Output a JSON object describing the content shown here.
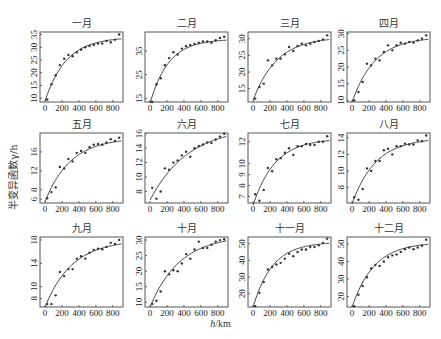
{
  "figure": {
    "ylabel": "半变异函数γ/h",
    "xlabel_var": "h",
    "xlabel_unit": "/km"
  },
  "chart_data": [
    {
      "type": "scatter",
      "title": "一月",
      "xlabel": "h/km",
      "ylabel": "半变异函数γ/h",
      "xlim": [
        -60,
        920
      ],
      "ylim": [
        8.5,
        36
      ],
      "xticks": [
        0,
        200,
        400,
        600,
        800
      ],
      "yticks": [
        10,
        15,
        20,
        25,
        30,
        35
      ],
      "x": [
        25,
        75,
        125,
        175,
        225,
        275,
        325,
        375,
        425,
        475,
        525,
        575,
        625,
        675,
        725,
        775,
        825,
        875
      ],
      "y": [
        9.5,
        15.5,
        19,
        23,
        25.5,
        27,
        26.5,
        28,
        29,
        30,
        30.5,
        31,
        31.5,
        31.5,
        32.5,
        32,
        33,
        35
      ],
      "fit": {
        "nugget": 9,
        "sill": 34,
        "range": 250
      }
    },
    {
      "type": "scatter",
      "title": "二月",
      "xlabel": "h/km",
      "ylabel": "半变异函数γ/h",
      "xlim": [
        -60,
        920
      ],
      "ylim": [
        13.5,
        43
      ],
      "xticks": [
        0,
        200,
        400,
        600,
        800
      ],
      "yticks": [
        15,
        25,
        35
      ],
      "x": [
        25,
        75,
        125,
        175,
        225,
        275,
        325,
        375,
        425,
        475,
        525,
        575,
        625,
        675,
        725,
        775,
        825,
        875
      ],
      "y": [
        13.5,
        21,
        23.5,
        29,
        32,
        34.5,
        33.5,
        36,
        37,
        37.5,
        38,
        38.5,
        39,
        39,
        38.5,
        39.5,
        40.5,
        41
      ],
      "fit": {
        "nugget": 13,
        "sill": 40,
        "range": 220
      }
    },
    {
      "type": "scatter",
      "title": "三月",
      "xlabel": "h/km",
      "ylabel": "半变异函数γ/h",
      "xlim": [
        -60,
        920
      ],
      "ylim": [
        11,
        32
      ],
      "xticks": [
        0,
        200,
        400,
        600,
        800
      ],
      "yticks": [
        15,
        20,
        25,
        30
      ],
      "x": [
        25,
        75,
        125,
        175,
        225,
        275,
        325,
        375,
        425,
        475,
        525,
        575,
        625,
        675,
        725,
        775,
        825,
        875
      ],
      "y": [
        12,
        15.5,
        16.5,
        23.5,
        22,
        24,
        24,
        25.3,
        27.5,
        26.3,
        27.8,
        28.5,
        28,
        28.5,
        29,
        29.3,
        29.8,
        31
      ],
      "fit": {
        "nugget": 11.5,
        "sill": 30.5,
        "range": 280
      }
    },
    {
      "type": "scatter",
      "title": "四月",
      "xlabel": "h/km",
      "ylabel": "半变异函数γ/h",
      "xlim": [
        -60,
        920
      ],
      "ylim": [
        9.5,
        30.5
      ],
      "xticks": [
        0,
        200,
        400,
        600,
        800
      ],
      "yticks": [
        10,
        15,
        20,
        25,
        30
      ],
      "x": [
        25,
        75,
        125,
        175,
        225,
        275,
        325,
        375,
        425,
        475,
        525,
        575,
        625,
        675,
        725,
        775,
        825,
        875
      ],
      "y": [
        10,
        12.5,
        15.5,
        21,
        20.5,
        22.5,
        22,
        24.5,
        26.5,
        25,
        26.5,
        27.3,
        27,
        27.5,
        27.3,
        28,
        28.5,
        29.5
      ],
      "fit": {
        "nugget": 9.5,
        "sill": 29,
        "range": 270
      }
    },
    {
      "type": "scatter",
      "title": "五月",
      "xlabel": "h/km",
      "ylabel": "半变异函数γ/h",
      "xlim": [
        -60,
        920
      ],
      "ylim": [
        5.2,
        20
      ],
      "xticks": [
        0,
        200,
        400,
        600,
        800
      ],
      "yticks": [
        6,
        8,
        12,
        16
      ],
      "x": [
        25,
        75,
        125,
        175,
        225,
        275,
        325,
        375,
        425,
        475,
        525,
        575,
        625,
        675,
        725,
        775,
        825,
        875
      ],
      "y": [
        6.2,
        7.5,
        8.5,
        12.8,
        12.5,
        14.5,
        14,
        15.8,
        16.2,
        15.8,
        17,
        17.5,
        17.7,
        17.5,
        18,
        18.7,
        18.3,
        19
      ],
      "fit": {
        "nugget": 5.5,
        "sill": 19,
        "range": 300
      }
    },
    {
      "type": "scatter",
      "title": "六月",
      "xlabel": "h/km",
      "ylabel": "半变异函数γ/h",
      "xlim": [
        -60,
        920
      ],
      "ylim": [
        6.4,
        16.1
      ],
      "xticks": [
        0,
        200,
        400,
        600,
        800
      ],
      "yticks": [
        8,
        10,
        12,
        14,
        16
      ],
      "x": [
        25,
        75,
        125,
        175,
        225,
        275,
        325,
        375,
        425,
        475,
        525,
        575,
        625,
        675,
        725,
        775,
        825,
        875
      ],
      "y": [
        8.5,
        7,
        8,
        11.2,
        11,
        12,
        12.3,
        13,
        13.5,
        12.8,
        14,
        14.3,
        14.5,
        14.8,
        14.7,
        15.2,
        15.6,
        16
      ],
      "fit": {
        "nugget": 6.8,
        "sill": 17,
        "range": 450
      }
    },
    {
      "type": "scatter",
      "title": "七月",
      "xlabel": "h/km",
      "ylabel": "半变异函数γ/h",
      "xlim": [
        -60,
        920
      ],
      "ylim": [
        6.4,
        12.8
      ],
      "xticks": [
        0,
        200,
        400,
        600,
        800
      ],
      "yticks": [
        7,
        8,
        9,
        10,
        12
      ],
      "x": [
        25,
        75,
        125,
        175,
        225,
        275,
        325,
        375,
        425,
        475,
        525,
        575,
        625,
        675,
        725,
        775,
        825,
        875
      ],
      "y": [
        7.2,
        6.6,
        7.6,
        9.6,
        9.3,
        10.4,
        10.5,
        11,
        11.4,
        10.8,
        11.6,
        11.6,
        11.8,
        11.7,
        11.7,
        12,
        12,
        12.5
      ],
      "fit": {
        "nugget": 6.2,
        "sill": 12.3,
        "range": 260
      }
    },
    {
      "type": "scatter",
      "title": "八月",
      "xlabel": "h/km",
      "ylabel": "半变异函数γ/h",
      "xlim": [
        -60,
        920
      ],
      "ylim": [
        6.1,
        14.6
      ],
      "xticks": [
        0,
        200,
        400,
        600,
        800
      ],
      "yticks": [
        8,
        10,
        12,
        14
      ],
      "x": [
        25,
        75,
        125,
        175,
        225,
        275,
        325,
        375,
        425,
        475,
        525,
        575,
        625,
        675,
        725,
        775,
        825,
        875
      ],
      "y": [
        6.8,
        6.5,
        7.8,
        10.3,
        10,
        11.2,
        11.2,
        12.5,
        12.7,
        12,
        13,
        13,
        13.3,
        13.2,
        13.2,
        13.7,
        13.6,
        14.3
      ],
      "fit": {
        "nugget": 6,
        "sill": 14,
        "range": 280
      }
    },
    {
      "type": "scatter",
      "title": "九月",
      "xlabel": "h/km",
      "ylabel": "半变异函数γ/h",
      "xlim": [
        -60,
        920
      ],
      "ylim": [
        6.5,
        18.5
      ],
      "xticks": [
        0,
        200,
        400,
        600,
        800
      ],
      "yticks": [
        8,
        10,
        14,
        18
      ],
      "x": [
        25,
        75,
        125,
        175,
        225,
        275,
        325,
        375,
        425,
        475,
        525,
        575,
        625,
        675,
        725,
        775,
        825,
        875
      ],
      "y": [
        7,
        7,
        8.5,
        12.5,
        11.8,
        13,
        13,
        14.8,
        15.2,
        14.8,
        15.8,
        16.3,
        16.5,
        16.4,
        16.8,
        17.5,
        17.3,
        18
      ],
      "fit": {
        "nugget": 6.5,
        "sill": 18,
        "range": 320
      }
    },
    {
      "type": "scatter",
      "title": "十月",
      "xlabel": "h/km",
      "ylabel": "半变异函数γ/h",
      "xlim": [
        -60,
        920
      ],
      "ylim": [
        8.5,
        31
      ],
      "xticks": [
        0,
        200,
        400,
        600,
        800
      ],
      "yticks": [
        10,
        15,
        20,
        25,
        30
      ],
      "x": [
        25,
        75,
        125,
        175,
        225,
        275,
        325,
        375,
        425,
        475,
        525,
        575,
        625,
        675,
        725,
        775,
        825,
        875
      ],
      "y": [
        9.5,
        10.5,
        13.5,
        20,
        19,
        20.3,
        20,
        22.5,
        25.5,
        24,
        27,
        29.5,
        27.5,
        27.5,
        28.5,
        29.5,
        30,
        30.3
      ],
      "fit": {
        "nugget": 8.5,
        "sill": 31.5,
        "range": 350
      }
    },
    {
      "type": "scatter",
      "title": "十一月",
      "xlabel": "h/km",
      "ylabel": "半变异函数γ/h",
      "xlim": [
        -60,
        920
      ],
      "ylim": [
        12,
        54
      ],
      "xticks": [
        0,
        200,
        400,
        600,
        800
      ],
      "yticks": [
        20,
        30,
        40,
        50
      ],
      "x": [
        25,
        75,
        125,
        175,
        225,
        275,
        325,
        375,
        425,
        475,
        525,
        575,
        625,
        675,
        725,
        775,
        825,
        875
      ],
      "y": [
        12.5,
        20.5,
        27,
        34.5,
        36,
        37.5,
        38.5,
        41,
        44,
        42.5,
        45,
        46.5,
        46.5,
        48,
        48,
        49,
        50.5,
        53
      ],
      "fit": {
        "nugget": 12,
        "sill": 51,
        "range": 230
      }
    },
    {
      "type": "scatter",
      "title": "十二月",
      "xlabel": "h/km",
      "ylabel": "半变异函数γ/h",
      "xlim": [
        -60,
        920
      ],
      "ylim": [
        14,
        54
      ],
      "xticks": [
        0,
        200,
        400,
        600,
        800
      ],
      "yticks": [
        20,
        30,
        40,
        50
      ],
      "x": [
        25,
        75,
        125,
        175,
        225,
        275,
        325,
        375,
        425,
        475,
        525,
        575,
        625,
        675,
        725,
        775,
        825,
        875
      ],
      "y": [
        14.5,
        21,
        26,
        31,
        36,
        38,
        37.5,
        40,
        42.5,
        43.5,
        44,
        45.5,
        47,
        48,
        47,
        48,
        49,
        52.5
      ],
      "fit": {
        "nugget": 14,
        "sill": 51,
        "range": 260
      }
    }
  ]
}
